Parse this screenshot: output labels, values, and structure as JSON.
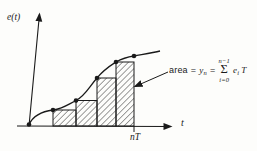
{
  "colors": {
    "ink": "#1a1a1a",
    "paper": "#fdfdfb"
  },
  "axis": {
    "y_label": "e(t)",
    "x_label": "t",
    "tick_label": "nT"
  },
  "annotation": {
    "word": "area",
    "eq": "=",
    "var": "y",
    "var_sub": "n",
    "sum_upper": "n−1",
    "sigma": "Σ",
    "sum_lower": "i=0",
    "term_base": "e",
    "term_sub": "i",
    "term_factor": "T"
  },
  "figure": {
    "type": "staircase-area-approximation",
    "axis_baseline_y": 126,
    "samples": [
      [
        29,
        124.5
      ],
      [
        53,
        110
      ],
      [
        76,
        100.5
      ],
      [
        97,
        78
      ],
      [
        116,
        62
      ],
      [
        134,
        56
      ]
    ],
    "bars": [
      {
        "x": 53,
        "top": 110,
        "w": 23
      },
      {
        "x": 76,
        "top": 100.5,
        "w": 21
      },
      {
        "x": 97,
        "top": 78,
        "w": 19
      },
      {
        "x": 116,
        "top": 62,
        "w": 18
      }
    ],
    "dot_radius": 2.3
  }
}
